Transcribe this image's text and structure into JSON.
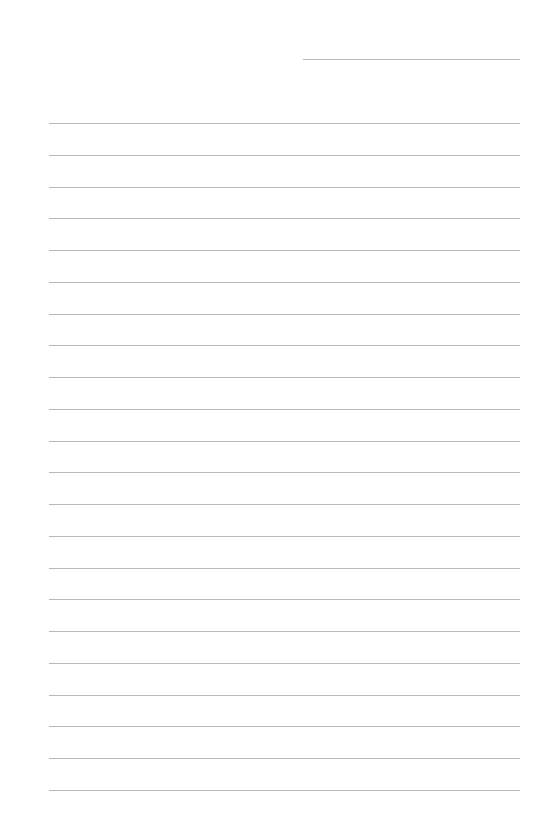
{
  "page": {
    "type": "lined-paper",
    "title_line": {
      "x": 303,
      "y": 59,
      "width": 217
    },
    "rules": {
      "count": 22,
      "start_y": 123,
      "spacing": 31.75,
      "x": 49,
      "width": 471
    },
    "colors": {
      "background": "#ffffff",
      "rule": "#b8b8b8"
    }
  }
}
